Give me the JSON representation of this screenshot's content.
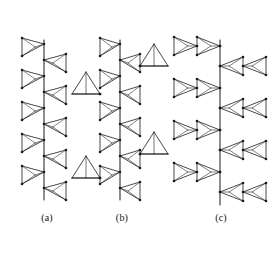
{
  "figure": {
    "background_color": "#ffffff",
    "stroke_color": "#1a1a1a",
    "node_color": "#1a1a1a",
    "width": 279,
    "height": 255
  },
  "labels": {
    "a": "(a)",
    "b": "(b)",
    "c": "(c)"
  },
  "chart_data": {
    "type": "diagram",
    "subtitle": "",
    "xlabel": "",
    "ylabel": "",
    "legend": [],
    "panels": [
      {
        "id": "a",
        "label": "(a)",
        "description": "Single zig-zag chain of corner-sharing tetrahedra alternating left and right along a vertical backbone",
        "backbone_x": 44,
        "backbone_y_top": 40,
        "backbone_y_bottom": 200,
        "label_x": 47,
        "label_y": 218,
        "unit_count": 10,
        "units": [
          {
            "index": 0,
            "side": "left",
            "apex_y": 44,
            "base_y_top": 38,
            "base_y_bottom": 56
          },
          {
            "index": 1,
            "side": "right",
            "apex_y": 60,
            "base_y_top": 54,
            "base_y_bottom": 72
          },
          {
            "index": 2,
            "side": "left",
            "apex_y": 76,
            "base_y_top": 70,
            "base_y_bottom": 88
          },
          {
            "index": 3,
            "side": "right",
            "apex_y": 92,
            "base_y_top": 86,
            "base_y_bottom": 104
          },
          {
            "index": 4,
            "side": "left",
            "apex_y": 108,
            "base_y_top": 102,
            "base_y_bottom": 120
          },
          {
            "index": 5,
            "side": "right",
            "apex_y": 124,
            "base_y_top": 118,
            "base_y_bottom": 136
          },
          {
            "index": 6,
            "side": "left",
            "apex_y": 140,
            "base_y_top": 134,
            "base_y_bottom": 152
          },
          {
            "index": 7,
            "side": "right",
            "apex_y": 156,
            "base_y_top": 150,
            "base_y_bottom": 168
          },
          {
            "index": 8,
            "side": "left",
            "apex_y": 172,
            "base_y_top": 166,
            "base_y_bottom": 184
          },
          {
            "index": 9,
            "side": "right",
            "apex_y": 188,
            "base_y_top": 182,
            "base_y_bottom": 200
          }
        ]
      },
      {
        "id": "b",
        "label": "(b)",
        "description": "Zig-zag chain with additional pendant triangles branching to the left and right",
        "backbone_x": 120,
        "backbone_y_top": 40,
        "backbone_y_bottom": 200,
        "label_x": 122,
        "label_y": 218,
        "unit_count": 10,
        "units": [
          {
            "index": 0,
            "side": "left",
            "apex_y": 44,
            "base_y_top": 38,
            "base_y_bottom": 56
          },
          {
            "index": 1,
            "side": "right",
            "apex_y": 60,
            "base_y_top": 54,
            "base_y_bottom": 72
          },
          {
            "index": 2,
            "side": "left",
            "apex_y": 76,
            "base_y_top": 70,
            "base_y_bottom": 88
          },
          {
            "index": 3,
            "side": "right",
            "apex_y": 92,
            "base_y_top": 86,
            "base_y_bottom": 104
          },
          {
            "index": 4,
            "side": "left",
            "apex_y": 108,
            "base_y_top": 102,
            "base_y_bottom": 120
          },
          {
            "index": 5,
            "side": "right",
            "apex_y": 124,
            "base_y_top": 118,
            "base_y_bottom": 136
          },
          {
            "index": 6,
            "side": "left",
            "apex_y": 140,
            "base_y_top": 134,
            "base_y_bottom": 152
          },
          {
            "index": 7,
            "side": "right",
            "apex_y": 156,
            "base_y_top": 150,
            "base_y_bottom": 168
          },
          {
            "index": 8,
            "side": "left",
            "apex_y": 172,
            "base_y_top": 166,
            "base_y_bottom": 184
          },
          {
            "index": 9,
            "side": "right",
            "apex_y": 188,
            "base_y_top": 182,
            "base_y_bottom": 200
          }
        ],
        "branches": [
          {
            "index": 0,
            "side": "right",
            "attach_unit": 1,
            "attach_x": 140,
            "attach_y": 66,
            "tip_x": 168,
            "tip_y": 66,
            "apex_x": 154,
            "apex_y": 44
          },
          {
            "index": 1,
            "side": "left",
            "attach_unit": 2,
            "attach_x": 100,
            "attach_y": 94,
            "tip_x": 72,
            "tip_y": 94,
            "apex_x": 86,
            "apex_y": 72
          },
          {
            "index": 2,
            "side": "right",
            "attach_unit": 5,
            "attach_x": 140,
            "attach_y": 154,
            "tip_x": 168,
            "tip_y": 154,
            "apex_x": 154,
            "apex_y": 132
          },
          {
            "index": 3,
            "side": "left",
            "attach_unit": 6,
            "attach_x": 100,
            "attach_y": 178,
            "tip_x": 72,
            "tip_y": 178,
            "apex_x": 86,
            "apex_y": 156
          }
        ]
      },
      {
        "id": "c",
        "label": "(c)",
        "description": "Chain of double (bow-tie) tetrahedra units, alternately extending left and right from the vertical backbone",
        "backbone_x": 220,
        "backbone_y_top": 40,
        "backbone_y_bottom": 205,
        "label_x": 221,
        "label_y": 218,
        "unit_count": 8,
        "units": [
          {
            "index": 0,
            "side": "left",
            "center_y": 46,
            "span": 46
          },
          {
            "index": 1,
            "side": "right",
            "center_y": 66,
            "span": 46
          },
          {
            "index": 2,
            "side": "left",
            "center_y": 88,
            "span": 46
          },
          {
            "index": 3,
            "side": "right",
            "center_y": 108,
            "span": 46
          },
          {
            "index": 4,
            "side": "left",
            "center_y": 130,
            "span": 46
          },
          {
            "index": 5,
            "side": "right",
            "center_y": 150,
            "span": 46
          },
          {
            "index": 6,
            "side": "left",
            "center_y": 172,
            "span": 46
          },
          {
            "index": 7,
            "side": "right",
            "center_y": 192,
            "span": 46
          }
        ]
      }
    ]
  }
}
